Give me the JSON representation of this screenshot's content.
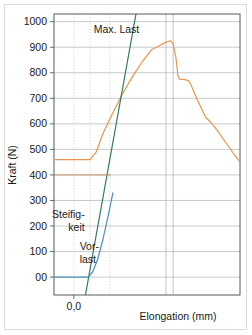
{
  "chart_data": {
    "type": "line",
    "title": "",
    "xlabel": "Elongation (mm)",
    "ylabel": "Kraft (N)",
    "ylim": [
      -70,
      1030
    ],
    "xlim": [
      -0.55,
      4.6
    ],
    "grid": true,
    "legend_position": "none",
    "ytick_labels": [
      "1000",
      "900",
      "800",
      "700",
      "600",
      "500",
      "400",
      "300",
      "200",
      "100",
      "00"
    ],
    "ytick_values": [
      1000,
      900,
      800,
      700,
      600,
      500,
      400,
      300,
      200,
      100,
      0
    ],
    "xtick_labels": [
      "0,0"
    ],
    "xtick_values": [
      0.0
    ],
    "vertical_gridlines": [
      0.0,
      0.45,
      1.0,
      2.55,
      2.75
    ],
    "colors": {
      "load_curve": "#e8954f",
      "stiffness_line": "#2e7d5b",
      "preload_line": "#4a90b8",
      "grid": "#b8bcc4",
      "axis": "#555a60",
      "frame": "#dcdcdc",
      "text": "#1a1a1a"
    },
    "series": [
      {
        "name": "load_curve",
        "label": "Kraft-Verlängerung Kurve",
        "color": "#e8954f",
        "points": [
          [
            -0.52,
            460
          ],
          [
            0.0,
            460
          ],
          [
            0.45,
            460
          ],
          [
            0.62,
            490
          ],
          [
            0.8,
            560
          ],
          [
            1.0,
            620
          ],
          [
            1.3,
            705
          ],
          [
            1.6,
            780
          ],
          [
            1.9,
            845
          ],
          [
            2.15,
            890
          ],
          [
            2.35,
            905
          ],
          [
            2.55,
            920
          ],
          [
            2.68,
            925
          ],
          [
            2.75,
            912
          ],
          [
            2.83,
            855
          ],
          [
            2.88,
            790
          ],
          [
            2.92,
            775
          ],
          [
            3.08,
            773
          ],
          [
            3.18,
            768
          ],
          [
            3.25,
            750
          ],
          [
            3.4,
            700
          ],
          [
            3.55,
            655
          ],
          [
            3.65,
            625
          ],
          [
            3.78,
            608
          ],
          [
            3.95,
            578
          ],
          [
            4.2,
            528
          ],
          [
            4.45,
            478
          ],
          [
            4.58,
            455
          ]
        ]
      },
      {
        "name": "stiffness_line",
        "label": "Steifigkeit",
        "color": "#2e7d5b",
        "points": [
          [
            0.32,
            -70
          ],
          [
            1.72,
            1030
          ]
        ]
      },
      {
        "name": "preload_line",
        "label": "Vorlast",
        "color": "#4a90b8",
        "points": [
          [
            -0.52,
            0
          ],
          [
            0.4,
            0
          ],
          [
            0.52,
            20
          ],
          [
            0.66,
            70
          ],
          [
            0.8,
            145
          ],
          [
            0.95,
            240
          ],
          [
            1.08,
            330
          ]
        ]
      },
      {
        "name": "preload_reference",
        "label": "Vorlast Referenz",
        "color": "#c98a5e",
        "points": [
          [
            -0.52,
            400
          ],
          [
            1.02,
            400
          ]
        ]
      }
    ],
    "annotations": [
      {
        "name": "max-last",
        "text": "Max. Last",
        "x": 0.55,
        "y": 955,
        "align": "start",
        "lines": [
          "Max. Last"
        ]
      },
      {
        "name": "steifigkeit",
        "text": "Steifigkeit",
        "x": 0.3,
        "y": 230,
        "align": "end",
        "lines": [
          "Steifig-",
          "keit"
        ]
      },
      {
        "name": "vorlast",
        "text": "Vorlast",
        "x": 0.16,
        "y": 105,
        "align": "start",
        "lines": [
          "Vor-",
          "last"
        ]
      }
    ]
  }
}
